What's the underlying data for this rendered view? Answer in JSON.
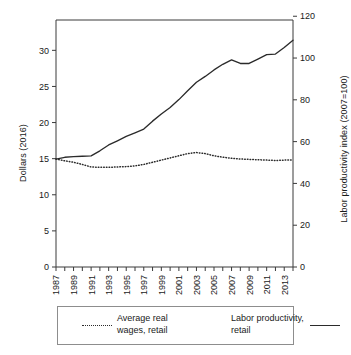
{
  "chart_data": {
    "type": "line",
    "title": "",
    "xlabel": "",
    "ylabel": "Dollars (2016)",
    "y2label": "Labor productivity index (2007=100)",
    "xlim": [
      1987,
      2014
    ],
    "ylim": [
      0,
      34.2
    ],
    "y2lim": [
      0,
      118.2
    ],
    "grid": false,
    "legend_position": "bottom",
    "y_ticks": [
      0,
      5,
      10,
      15,
      20,
      25,
      30
    ],
    "y_tick_labels": [
      "0",
      "5",
      "10",
      "15",
      "20",
      "25",
      "30"
    ],
    "y2_ticks": [
      0,
      20,
      40,
      60,
      80,
      100,
      120
    ],
    "y2_tick_labels": [
      "0",
      "20",
      "40",
      "60",
      "80",
      "100",
      "120"
    ],
    "x_ticks": [
      1987,
      1988,
      1989,
      1990,
      1991,
      1992,
      1993,
      1994,
      1995,
      1996,
      1997,
      1998,
      1999,
      2000,
      2001,
      2002,
      2003,
      2004,
      2005,
      2006,
      2007,
      2008,
      2009,
      2010,
      2011,
      2012,
      2013,
      2014
    ],
    "x_tick_labels": [
      "1987",
      "1989",
      "1991",
      "1993",
      "1995",
      "1997",
      "1999",
      "2001",
      "2003",
      "2005",
      "2007",
      "2009",
      "2011",
      "2013"
    ],
    "x_tick_label_years": [
      1987,
      1989,
      1991,
      1993,
      1995,
      1997,
      1999,
      2001,
      2003,
      2005,
      2007,
      2009,
      2011,
      2013
    ],
    "x": [
      1987,
      1988,
      1989,
      1990,
      1991,
      1992,
      1993,
      1994,
      1995,
      1996,
      1997,
      1998,
      1999,
      2000,
      2001,
      2002,
      2003,
      2004,
      2005,
      2006,
      2007,
      2008,
      2009,
      2010,
      2011,
      2012,
      2013,
      2014
    ],
    "series": [
      {
        "name": "Average real wages, retail",
        "axis": "left",
        "style": "dotted",
        "color": "#2b2b2b",
        "units": "Dollars (2016)",
        "values": [
          14.95,
          14.7,
          14.5,
          14.2,
          13.85,
          13.8,
          13.8,
          13.85,
          13.9,
          14.0,
          14.2,
          14.5,
          14.8,
          15.1,
          15.4,
          15.7,
          15.85,
          15.7,
          15.4,
          15.2,
          15.05,
          14.95,
          14.9,
          14.85,
          14.8,
          14.75,
          14.8,
          14.8
        ]
      },
      {
        "name": "Labor productivity, retail",
        "axis": "right",
        "style": "solid",
        "color": "#2b2b2b",
        "units": "Labor productivity index (2007=100)",
        "values_left_scale": [
          14.95,
          15.2,
          15.3,
          15.35,
          15.4,
          16.1,
          16.9,
          17.5,
          18.1,
          18.6,
          19.1,
          20.2,
          21.2,
          22.1,
          23.2,
          24.4,
          25.6,
          26.4,
          27.3,
          28.1,
          28.7,
          28.2,
          28.2,
          28.8,
          29.4,
          29.5,
          30.4,
          31.4
        ],
        "values": [
          51.6,
          52.5,
          52.8,
          53.0,
          53.2,
          55.6,
          58.4,
          60.4,
          62.5,
          64.2,
          66.0,
          69.8,
          73.2,
          76.3,
          80.1,
          84.3,
          88.4,
          91.2,
          94.3,
          97.0,
          99.1,
          97.4,
          97.4,
          99.5,
          101.6,
          101.9,
          105.0,
          108.5
        ]
      }
    ]
  },
  "legend": {
    "entries": [
      {
        "label_line1": "Average real",
        "label_line2": "wages, retail",
        "style": "dotted"
      },
      {
        "label_line1": "Labor productivity,",
        "label_line2": "retail",
        "style": "solid"
      }
    ]
  }
}
